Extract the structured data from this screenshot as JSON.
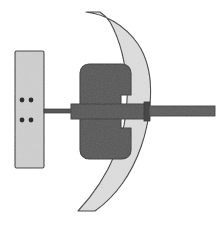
{
  "figure": {
    "canvas": {
      "width": 224,
      "height": 229,
      "background": "#ffffff"
    },
    "colors": {
      "background": "#ffffff",
      "light_fill": "#dedede",
      "mid_fill": "#c9c9c9",
      "dark_fill": "#575757",
      "outline": "#3a3a3a",
      "hole_fill": "#2e2e2e"
    },
    "parts": [
      {
        "id": "mounting-plate",
        "label": "Mounting plate",
        "shape": "rectangle",
        "fill": "#cfcfcf",
        "x": 15,
        "y": 51,
        "width": 29,
        "height": 117
      },
      {
        "id": "plate-holes",
        "label": "Fastener holes",
        "shape": "circles",
        "fill": "#2e2e2e",
        "radius": 2.4,
        "points": [
          {
            "cx": 22,
            "cy": 100
          },
          {
            "cx": 31,
            "cy": 100
          },
          {
            "cx": 22,
            "cy": 120
          },
          {
            "cx": 31,
            "cy": 120
          }
        ]
      },
      {
        "id": "curved-blade",
        "label": "Curved blade arc",
        "shape": "arc-band",
        "fill": "#dedede",
        "top_start_x": 86,
        "top_end_x": 120,
        "top_y": 12,
        "outer_max_x": 150,
        "bottom_start_x": 78,
        "bottom_end_x": 116,
        "bottom_y": 211
      },
      {
        "id": "notched-body",
        "label": "Notched body block",
        "shape": "rounded-notched-rectangle",
        "fill": "#575757",
        "x": 80,
        "y": 64,
        "width": 51,
        "height": 95,
        "corner_radius": 9,
        "notch_depth": 10,
        "notch_top_y": 95,
        "notch_bottom_y": 128
      },
      {
        "id": "thin-left-rod",
        "label": "Thin left connecting rod",
        "shape": "rectangle",
        "fill": "#575757",
        "x": 44,
        "y": 109,
        "width": 28,
        "height": 4
      },
      {
        "id": "main-shaft-bar",
        "label": "Main shaft bar",
        "shape": "rectangle",
        "fill": "#575757",
        "x": 71,
        "y": 104,
        "width": 76,
        "height": 15
      },
      {
        "id": "shaft-collar",
        "label": "Shaft collar",
        "shape": "rectangle",
        "fill": "#4a4a4a",
        "x": 145,
        "y": 103,
        "width": 5,
        "height": 17
      },
      {
        "id": "right-rod",
        "label": "Right extension rod",
        "shape": "rectangle",
        "fill": "#5c5c5c",
        "x": 149,
        "y": 106,
        "width": 66,
        "height": 10
      }
    ]
  }
}
